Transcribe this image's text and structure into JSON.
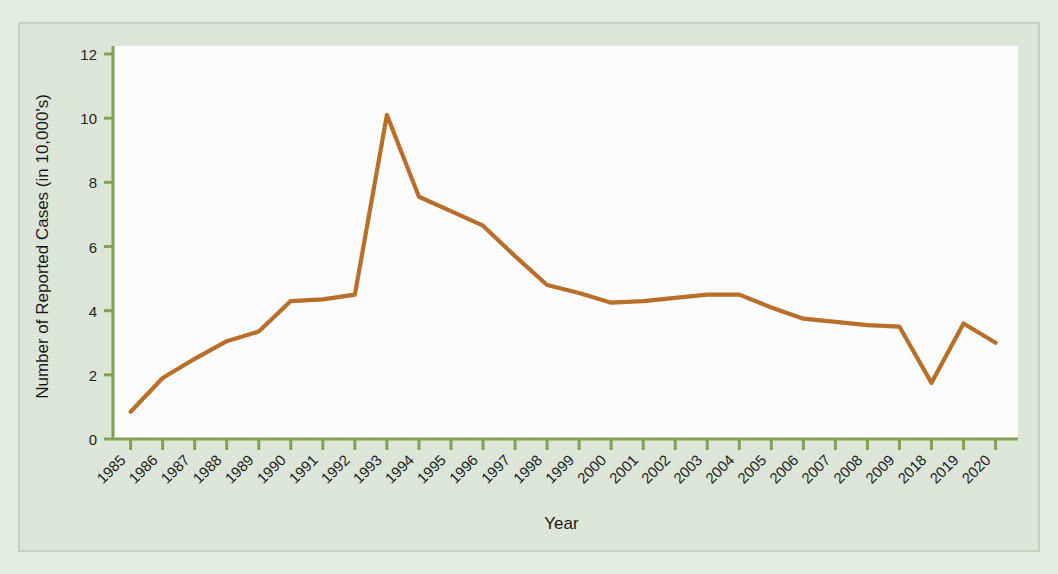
{
  "chart_data": {
    "type": "line",
    "title": "",
    "xlabel": "Year",
    "ylabel": "Number of Reported Cases  (in 10,000's)",
    "categories": [
      "1985",
      "1986",
      "1987",
      "1988",
      "1989",
      "1990",
      "1991",
      "1992",
      "1993",
      "1994",
      "1995",
      "1996",
      "1997",
      "1998",
      "1999",
      "2000",
      "2001",
      "2002",
      "2003",
      "2004",
      "2005",
      "2006",
      "2007",
      "2008",
      "2009",
      "2018",
      "2019",
      "2020"
    ],
    "values": [
      0.85,
      1.9,
      2.5,
      3.05,
      3.35,
      4.3,
      4.35,
      4.5,
      10.1,
      7.55,
      7.1,
      6.65,
      5.7,
      4.8,
      4.55,
      4.25,
      4.3,
      4.4,
      4.5,
      4.5,
      4.1,
      3.75,
      3.65,
      3.55,
      3.5,
      1.75,
      3.6,
      3.0
    ],
    "ylim": [
      0,
      12
    ],
    "yticks": [
      0,
      2,
      4,
      6,
      8,
      10,
      12
    ],
    "ytick_labels": [
      "0",
      "2",
      "4",
      "6",
      "8",
      "10",
      "12"
    ],
    "grid": false,
    "legend": "none",
    "series_color": "#b8691f",
    "axis_color": "#7d9e4e",
    "plot_background": "#ffffff",
    "figure_background": "#dde8d9"
  }
}
